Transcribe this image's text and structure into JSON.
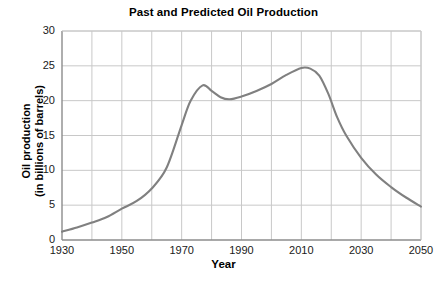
{
  "chart_data": {
    "type": "line",
    "title": "Past and Predicted Oil Production",
    "xlabel": "Year",
    "ylabel_line1": "Oil production",
    "ylabel_line2": "(in billions of barrels)",
    "xlim": [
      1930,
      2050
    ],
    "ylim": [
      0,
      30
    ],
    "xticks": [
      1930,
      1950,
      1970,
      1990,
      2010,
      2030,
      2050
    ],
    "xtick_labels": [
      "1930",
      "1950",
      "1970",
      "1990",
      "2010",
      "2030",
      "2050"
    ],
    "yticks": [
      0,
      5,
      10,
      15,
      20,
      25,
      30
    ],
    "ytick_labels": [
      "0",
      "5",
      "10",
      "15",
      "20",
      "25",
      "30"
    ],
    "grid": true,
    "grid_x_step": 10,
    "grid_y_step": 5,
    "legend": null,
    "line_color": "#808080",
    "grid_color": "#c8c8c8",
    "axis_color": "#808080",
    "series": [
      {
        "name": "Oil production",
        "x": [
          1930,
          1935,
          1940,
          1945,
          1950,
          1955,
          1960,
          1965,
          1970,
          1973,
          1977,
          1980,
          1983,
          1986,
          1990,
          1995,
          2000,
          2005,
          2010,
          2013,
          2016,
          2019,
          2022,
          2025,
          2030,
          2035,
          2040,
          2045,
          2050
        ],
        "y": [
          1.2,
          1.8,
          2.5,
          3.3,
          4.5,
          5.6,
          7.4,
          10.4,
          16.5,
          20.0,
          22.2,
          21.4,
          20.5,
          20.2,
          20.6,
          21.4,
          22.4,
          23.7,
          24.7,
          24.6,
          23.6,
          21.0,
          17.6,
          15.0,
          11.8,
          9.4,
          7.6,
          6.1,
          4.8
        ]
      }
    ]
  },
  "annotations": {
    "peak_1977": 22.2,
    "trough_1986": 20.2,
    "peak_2010": 24.7,
    "start_1930": 1.2,
    "end_2050": 4.8
  }
}
